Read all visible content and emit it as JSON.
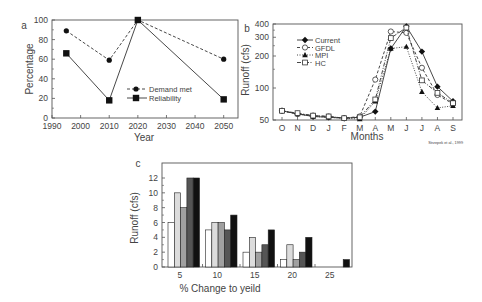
{
  "citation": "Strzepek et al., 1999",
  "chart_data": [
    {
      "id": "a",
      "panel_label": "a",
      "type": "line",
      "title": "",
      "xlabel": "Year",
      "ylabel": "Percentage",
      "xlim": [
        1990,
        2055
      ],
      "ylim": [
        0,
        100
      ],
      "xticks": [
        1990,
        2000,
        2010,
        2020,
        2030,
        2040,
        2050
      ],
      "yticks": [
        0,
        20,
        40,
        60,
        80,
        100
      ],
      "grid": false,
      "legend_position": "center-right",
      "x": [
        1995,
        2010,
        2020,
        2050
      ],
      "series": [
        {
          "name": "Demand met",
          "marker": "circle",
          "line": "dashed",
          "values": [
            89,
            59,
            100,
            60
          ]
        },
        {
          "name": "Reliability",
          "marker": "square",
          "line": "solid",
          "values": [
            66,
            18,
            100,
            19
          ]
        }
      ]
    },
    {
      "id": "b",
      "panel_label": "b",
      "type": "line",
      "title": "",
      "xlabel": "Months",
      "ylabel": "Runoff (cfs)",
      "ylim": [
        50,
        400
      ],
      "yticks": [
        50,
        100,
        200,
        300,
        400
      ],
      "y_scale": "log",
      "grid": false,
      "legend_position": "upper-left",
      "categories": [
        "O",
        "N",
        "D",
        "J",
        "F",
        "M",
        "A",
        "M",
        "J",
        "J",
        "A",
        "S"
      ],
      "series": [
        {
          "name": "Current",
          "marker": "filled-diamond",
          "line": "solid",
          "values": [
            61,
            57,
            54,
            53,
            52,
            53,
            60,
            235,
            380,
            220,
            103,
            75
          ]
        },
        {
          "name": "GFDL",
          "marker": "open-circle",
          "line": "dashed",
          "values": [
            61,
            57,
            55,
            54,
            52,
            54,
            120,
            340,
            330,
            155,
            86,
            71
          ]
        },
        {
          "name": "MPI",
          "marker": "filled-triangle",
          "line": "dotted",
          "values": [
            61,
            57,
            54,
            53,
            52,
            51,
            75,
            235,
            245,
            92,
            65,
            68
          ]
        },
        {
          "name": "HC",
          "marker": "open-square",
          "line": "dash-dot",
          "values": [
            61,
            58,
            55,
            54,
            52,
            53,
            78,
            295,
            370,
            118,
            90,
            72
          ]
        }
      ]
    },
    {
      "id": "c",
      "panel_label": "c",
      "type": "bar",
      "title": "",
      "xlabel": "% Change to yeild",
      "ylabel": "Runoff (cfs)",
      "ylim": [
        0,
        13
      ],
      "yticks": [
        0,
        2,
        4,
        6,
        8,
        10,
        12
      ],
      "grid": false,
      "categories": [
        "5",
        "10",
        "15",
        "20",
        "25"
      ],
      "series": [
        {
          "name": "s1",
          "color": "#ffffff",
          "values": [
            6,
            5,
            2,
            1,
            0
          ]
        },
        {
          "name": "s2",
          "color": "#dcdcdc",
          "values": [
            10,
            6,
            4,
            3,
            0
          ]
        },
        {
          "name": "s3",
          "color": "#a0a0a0",
          "values": [
            8,
            6,
            2,
            1,
            0
          ]
        },
        {
          "name": "s4",
          "color": "#555555",
          "values": [
            12,
            5,
            3,
            2,
            0
          ]
        },
        {
          "name": "s5",
          "color": "#111111",
          "values": [
            12,
            7,
            5,
            4,
            1
          ]
        }
      ]
    }
  ]
}
